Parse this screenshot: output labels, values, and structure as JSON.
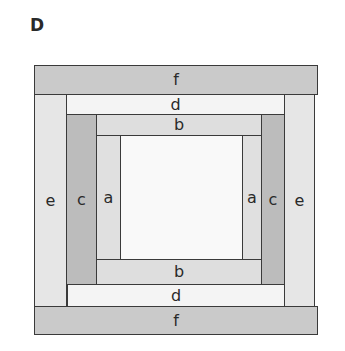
{
  "title": "D",
  "strips": {
    "f_top": {
      "label": "f",
      "color": "#cacaca"
    },
    "d_top": {
      "label": "d",
      "color": "#f4f4f4"
    },
    "b_top": {
      "label": "b",
      "color": "#dedede"
    },
    "e_left": {
      "label": "e",
      "color": "#e6e6e6"
    },
    "c_left": {
      "label": "c",
      "color": "#bcbcbc"
    },
    "a_left": {
      "label": "a",
      "color": "#e0e0e0"
    },
    "center": {
      "label": "",
      "color": "#f9f9f9"
    },
    "a_right": {
      "label": "a",
      "color": "#e0e0e0"
    },
    "c_right": {
      "label": "c",
      "color": "#bcbcbc"
    },
    "e_right": {
      "label": "e",
      "color": "#e6e6e6"
    },
    "b_bottom": {
      "label": "b",
      "color": "#dedede"
    },
    "d_bottom": {
      "label": "d",
      "color": "#f4f4f4"
    },
    "f_bottom": {
      "label": "f",
      "color": "#cacaca"
    }
  }
}
